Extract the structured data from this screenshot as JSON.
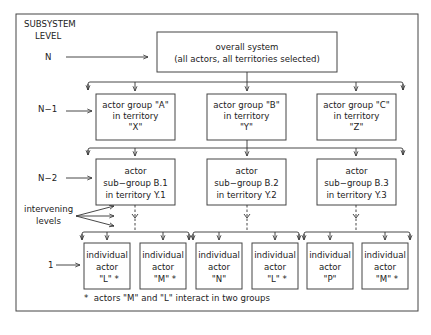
{
  "level_header": [
    "SUBSYSTEM",
    "LEVEL"
  ],
  "levels": {
    "n": "N",
    "n1": "N−1",
    "n2": "N−2",
    "one": "1"
  },
  "intervening_label": [
    "intervening",
    "levels"
  ],
  "top_box": {
    "lines": [
      "overall system",
      "(all actors, all territories selected)"
    ]
  },
  "groups": [
    {
      "lines": [
        "actor group \"A\"",
        "in territory",
        "\"X\""
      ]
    },
    {
      "lines": [
        "actor group \"B\"",
        "in territory",
        "\"Y\""
      ]
    },
    {
      "lines": [
        "actor group \"C\"",
        "in territory",
        "\"Z\""
      ]
    }
  ],
  "subgroups": [
    {
      "lines": [
        "actor",
        "sub−group B.1",
        "in territory Y.1"
      ]
    },
    {
      "lines": [
        "actor",
        "sub−group B.2",
        "in territory Y.2"
      ]
    },
    {
      "lines": [
        "actor",
        "sub−group B.3",
        "in territory Y.3"
      ]
    }
  ],
  "individuals": [
    {
      "lines": [
        "individual",
        "actor",
        "\"L\"  *"
      ]
    },
    {
      "lines": [
        "individual",
        "actor",
        "\"M\"  *"
      ]
    },
    {
      "lines": [
        "individual",
        "actor",
        "\"N\""
      ]
    },
    {
      "lines": [
        "individual",
        "actor",
        "\"L\" *"
      ]
    },
    {
      "lines": [
        "individual",
        "actor",
        "\"P\""
      ]
    },
    {
      "lines": [
        "individual",
        "actor",
        "\"M\" *"
      ]
    }
  ],
  "footnote": "*  actors \"M\" and \"L\" interact in two groups"
}
